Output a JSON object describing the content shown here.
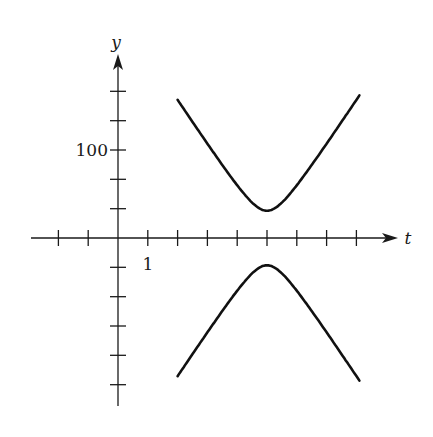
{
  "chart_data": {
    "type": "line",
    "title": "",
    "xlabel": "t",
    "ylabel": "y",
    "x_tick_label": {
      "value": 1,
      "text": "1"
    },
    "y_tick_label": {
      "value": 100,
      "text": "100"
    },
    "x_ticks": [
      -2,
      -1,
      1,
      2,
      3,
      4,
      5,
      6,
      7,
      8
    ],
    "y_ticks": [
      -166.7,
      -133.3,
      -100,
      -66.7,
      -33.3,
      33.3,
      66.7,
      100,
      133.3,
      166.7
    ],
    "xlim": [
      -2.9,
      9.3
    ],
    "ylim": [
      -190,
      210
    ],
    "grid": false,
    "legend": null,
    "series": [
      {
        "name": "upper branch",
        "x": [
          2.0,
          2.5,
          3.0,
          3.5,
          4.0,
          4.5,
          5.0,
          5.5,
          6.0,
          6.5,
          7.0,
          7.5,
          8.0,
          8.1
        ],
        "values": [
          157,
          131,
          106,
          81,
          60,
          40,
          31,
          40,
          60,
          81,
          106,
          131,
          157,
          161
        ]
      },
      {
        "name": "lower branch",
        "x": [
          2.0,
          2.5,
          3.0,
          3.5,
          4.0,
          4.5,
          5.0,
          5.5,
          6.0,
          6.5,
          7.0,
          7.5,
          8.0,
          8.1
        ],
        "values": [
          -157,
          -131,
          -106,
          -81,
          -60,
          -40,
          -31,
          -40,
          -60,
          -81,
          -106,
          -131,
          -157,
          -161
        ]
      }
    ],
    "annotations": [
      "Upper branch minimum at t≈5, y≈31",
      "Lower branch maximum at t≈5, y≈-31"
    ]
  },
  "labels": {
    "x_axis": "t",
    "y_axis": "y",
    "x_tick": "1",
    "y_tick": "100"
  }
}
